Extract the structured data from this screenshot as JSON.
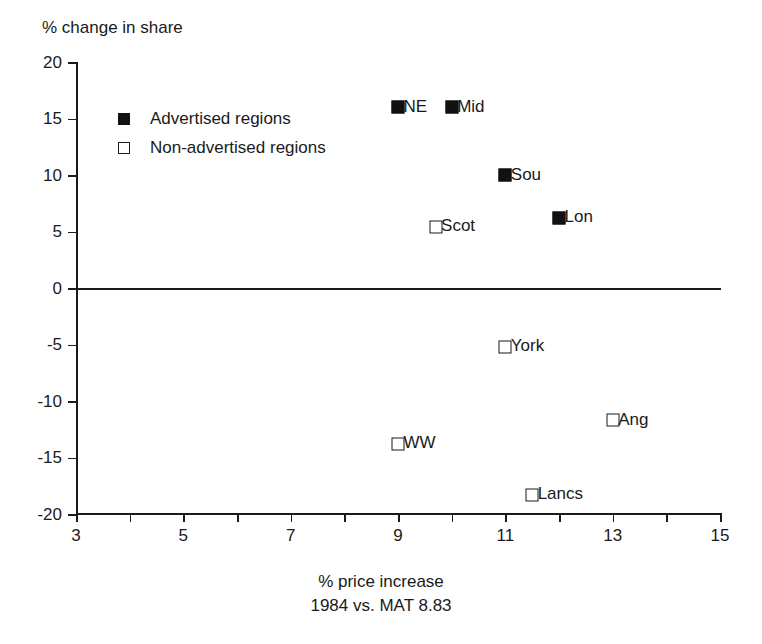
{
  "chart_data": {
    "type": "scatter",
    "title": "",
    "ylabel": "% change in share",
    "xlabel": "% price increase",
    "xlabel_sub": "1984 vs. MAT 8.83",
    "xlim": [
      3,
      15
    ],
    "ylim": [
      -20,
      20
    ],
    "grid": false,
    "legend_position": "upper-left-inside",
    "x_ticks": [
      {
        "value": 3,
        "label": "3",
        "major": true
      },
      {
        "value": 4,
        "label": "",
        "major": false
      },
      {
        "value": 5,
        "label": "5",
        "major": true
      },
      {
        "value": 6,
        "label": "",
        "major": false
      },
      {
        "value": 7,
        "label": "7",
        "major": true
      },
      {
        "value": 8,
        "label": "",
        "major": false
      },
      {
        "value": 9,
        "label": "9",
        "major": true
      },
      {
        "value": 10,
        "label": "",
        "major": false
      },
      {
        "value": 11,
        "label": "11",
        "major": true
      },
      {
        "value": 12,
        "label": "",
        "major": false
      },
      {
        "value": 13,
        "label": "13",
        "major": true
      },
      {
        "value": 14,
        "label": "",
        "major": false
      },
      {
        "value": 15,
        "label": "15",
        "major": true
      }
    ],
    "y_ticks": [
      {
        "value": 20,
        "label": "20"
      },
      {
        "value": 15,
        "label": "15"
      },
      {
        "value": 10,
        "label": "10"
      },
      {
        "value": 5,
        "label": "5"
      },
      {
        "value": 0,
        "label": "0"
      },
      {
        "value": -5,
        "label": "-5"
      },
      {
        "value": -10,
        "label": "-10"
      },
      {
        "value": -15,
        "label": "-15"
      },
      {
        "value": -20,
        "label": "-20"
      }
    ],
    "reference_lines": [
      {
        "axis": "y",
        "value": 0
      }
    ],
    "legend": [
      {
        "key": "advertised",
        "label": "Advertised regions",
        "marker": "filled-square"
      },
      {
        "key": "non_advertised",
        "label": "Non-advertised regions",
        "marker": "open-square"
      }
    ],
    "series": [
      {
        "name": "Advertised regions",
        "marker": "filled-square",
        "points": [
          {
            "label": "NE",
            "x": 9.0,
            "y": 16.0
          },
          {
            "label": "Mid",
            "x": 10.0,
            "y": 16.0
          },
          {
            "label": "Sou",
            "x": 11.0,
            "y": 10.0
          },
          {
            "label": "Lon",
            "x": 12.0,
            "y": 6.2
          }
        ]
      },
      {
        "name": "Non-advertised regions",
        "marker": "open-square",
        "points": [
          {
            "label": "Scot",
            "x": 9.7,
            "y": 5.4
          },
          {
            "label": "York",
            "x": 11.0,
            "y": -5.2
          },
          {
            "label": "Ang",
            "x": 13.0,
            "y": -11.7
          },
          {
            "label": "WW",
            "x": 9.0,
            "y": -13.8
          },
          {
            "label": "Lancs",
            "x": 11.5,
            "y": -18.3
          }
        ]
      }
    ]
  }
}
